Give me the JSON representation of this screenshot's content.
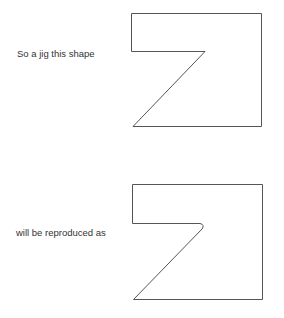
{
  "figure": {
    "original_caption": "So a jig this shape",
    "reproduced_caption": "will be reproduced as",
    "line_color": "#555555",
    "text_color": "#333333"
  }
}
